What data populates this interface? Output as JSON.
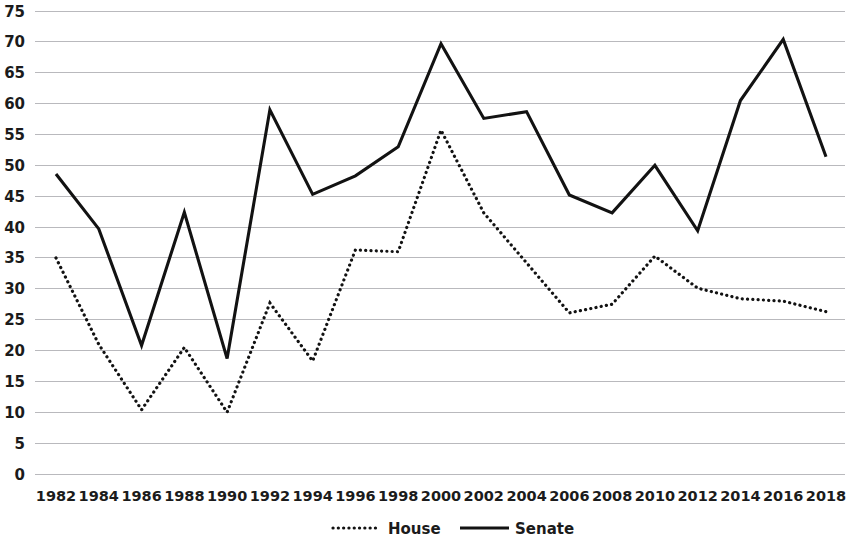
{
  "chart_data": {
    "type": "line",
    "title": "",
    "subtitle": "",
    "xlabel": "",
    "ylabel": "",
    "categories": [
      1982,
      1984,
      1986,
      1988,
      1990,
      1992,
      1994,
      1996,
      1998,
      2000,
      2002,
      2004,
      2006,
      2008,
      2010,
      2012,
      2014,
      2016,
      2018
    ],
    "xtick_labels": [
      "1982",
      "1984",
      "1986",
      "1988",
      "1990",
      "1992",
      "1994",
      "1996",
      "1998",
      "2000",
      "2002",
      "2004",
      "2006",
      "2008",
      "2010",
      "2012",
      "2014",
      "2016",
      "2018"
    ],
    "ytick_labels": [
      "0",
      "5",
      "10",
      "15",
      "20",
      "25",
      "30",
      "35",
      "40",
      "45",
      "50",
      "55",
      "60",
      "65",
      "70",
      "75"
    ],
    "ytick_values": [
      0,
      5,
      10,
      15,
      20,
      25,
      30,
      35,
      40,
      45,
      50,
      55,
      60,
      65,
      70,
      75
    ],
    "ylim": [
      0,
      75
    ],
    "grid": true,
    "grid_axis": "y",
    "legend_position": "bottom",
    "series": [
      {
        "name": "House",
        "style": "dotted",
        "color": "#121212",
        "values": [
          35.0,
          21.0,
          10.4,
          20.5,
          10.0,
          27.7,
          18.3,
          36.3,
          36.0,
          55.7,
          42.3,
          34.2,
          26.1,
          27.5,
          35.3,
          30.1,
          28.4,
          28.0,
          26.3
        ]
      },
      {
        "name": "Senate",
        "style": "solid",
        "color": "#121212",
        "values": [
          48.6,
          39.7,
          20.8,
          42.4,
          18.7,
          59.0,
          45.3,
          48.3,
          53.0,
          69.7,
          57.6,
          58.7,
          45.2,
          42.3,
          50.0,
          39.4,
          60.5,
          70.4,
          51.4
        ]
      }
    ]
  },
  "legend": {
    "entries": [
      {
        "label": "House",
        "style": "dotted"
      },
      {
        "label": "Senate",
        "style": "solid"
      }
    ]
  },
  "colors": {
    "grid": "#b9b9bd",
    "text": "#1b1b1b",
    "line": "#121212",
    "background": "#ffffff"
  }
}
